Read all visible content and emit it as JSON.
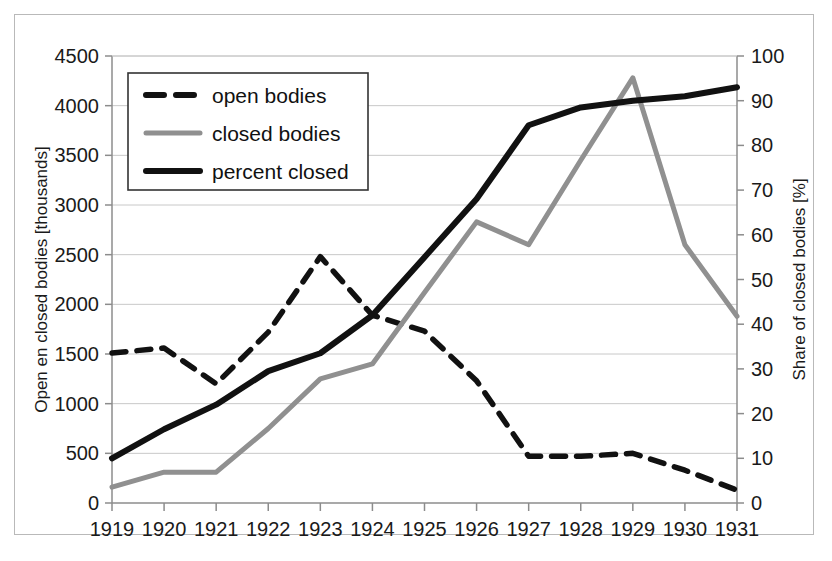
{
  "chart_data": {
    "type": "line",
    "title": "",
    "xlabel": "",
    "ylabel": "Open en closed bodies [thousands]",
    "y2label": "Share of closed bodies [%]",
    "categories": [
      "1919",
      "1920",
      "1921",
      "1922",
      "1923",
      "1924",
      "1925",
      "1926",
      "1927",
      "1928",
      "1929",
      "1930",
      "1931"
    ],
    "ylim": [
      0,
      4500
    ],
    "yticks": [
      "0",
      "500",
      "1000",
      "1500",
      "2000",
      "2500",
      "3000",
      "3500",
      "4000",
      "4500"
    ],
    "y2lim": [
      0,
      100
    ],
    "y2ticks": [
      "0",
      "10",
      "20",
      "30",
      "40",
      "50",
      "60",
      "70",
      "80",
      "90",
      "100"
    ],
    "grid": true,
    "legend_position": "upper-left",
    "series": [
      {
        "name": "open bodies",
        "axis": "left",
        "style": "dashed",
        "color": "#111111",
        "values": [
          1510,
          1560,
          1200,
          1720,
          2480,
          1890,
          1730,
          1230,
          470,
          470,
          500,
          330,
          130
        ]
      },
      {
        "name": "closed bodies",
        "axis": "left",
        "style": "solid",
        "color": "#909090",
        "values": [
          160,
          310,
          310,
          750,
          1250,
          1400,
          2120,
          2830,
          2600,
          3450,
          4280,
          2600,
          1880
        ]
      },
      {
        "name": "percent closed",
        "axis": "right",
        "style": "solid-thick",
        "color": "#111111",
        "values": [
          10,
          16.5,
          22,
          29.5,
          33.5,
          42,
          55,
          68,
          84.5,
          88.5,
          90,
          91,
          93
        ]
      }
    ]
  },
  "legend": {
    "items": [
      {
        "label": "open bodies",
        "swatch": "dashed-black"
      },
      {
        "label": "closed bodies",
        "swatch": "solid-gray"
      },
      {
        "label": "percent closed",
        "swatch": "solid-black"
      }
    ]
  },
  "axes": {
    "left_title": "Open en closed bodies [thousands]",
    "right_title": "Share of closed bodies [%]"
  }
}
